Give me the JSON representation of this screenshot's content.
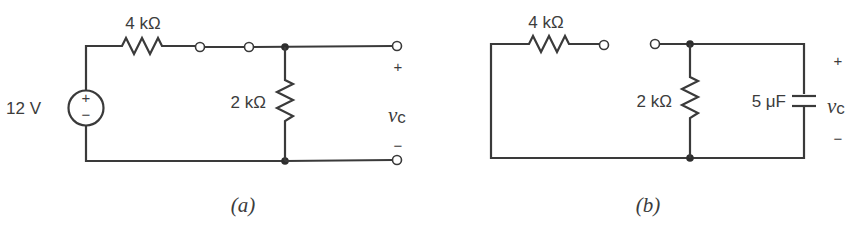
{
  "figure": {
    "circuits": [
      {
        "id": "a",
        "caption": "(a)",
        "components": {
          "source": {
            "type": "voltage-source",
            "label": "12 V",
            "plus": "+",
            "minus": "−"
          },
          "series_resistor": {
            "type": "resistor",
            "label": "4 kΩ"
          },
          "shunt_resistor": {
            "type": "resistor",
            "label": "2 kΩ"
          }
        },
        "output": {
          "plus": "+",
          "minus": "−",
          "voltage_symbol": "v",
          "voltage_subscript": "c"
        }
      },
      {
        "id": "b",
        "caption": "(b)",
        "components": {
          "series_resistor": {
            "type": "resistor",
            "label": "4 kΩ"
          },
          "shunt_resistor": {
            "type": "resistor",
            "label": "2 kΩ"
          },
          "capacitor": {
            "type": "capacitor",
            "label": "5 μF"
          }
        },
        "output": {
          "plus": "+",
          "minus": "−",
          "voltage_symbol": "v",
          "voltage_subscript": "c"
        }
      }
    ]
  }
}
